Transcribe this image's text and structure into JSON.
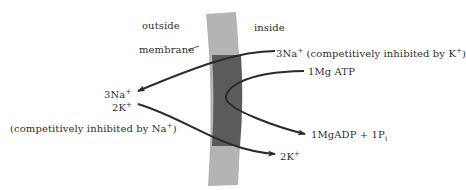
{
  "diagram": {
    "type": "membrane-transport-schematic",
    "regions": {
      "outside": "outside",
      "inside": "inside",
      "membrane": "membrane"
    },
    "labels": {
      "na_inside": "3Na",
      "na_inside_charge": "+",
      "na_inside_note_pre": " (competitively inhibited by K",
      "na_inside_note_charge": "+",
      "na_inside_note_post": ")",
      "atp": "1Mg ATP",
      "na_outside": "3Na",
      "na_outside_charge": "+",
      "k_outside": "2K",
      "k_outside_charge": "+",
      "k_outside_note_pre": "(competitively inhibited by Na",
      "k_outside_note_charge": "+",
      "k_outside_note_post": ")",
      "adp": "1MgADP + 1P",
      "adp_sub": "i",
      "k_inside": "2K",
      "k_inside_charge": "+"
    },
    "flows": [
      {
        "from": "3Na+ (inside)",
        "to": "3Na+ (outside)"
      },
      {
        "from": "2K+ (outside)",
        "to": "2K+ (inside)"
      },
      {
        "from": "1Mg ATP",
        "to": "1MgADP + 1Pi"
      }
    ],
    "colors": {
      "membrane_light": "#b4b4b4",
      "membrane_dark": "#5b5b5b",
      "arrow": "#2b2b2b",
      "text": "#2e2e2e"
    }
  }
}
